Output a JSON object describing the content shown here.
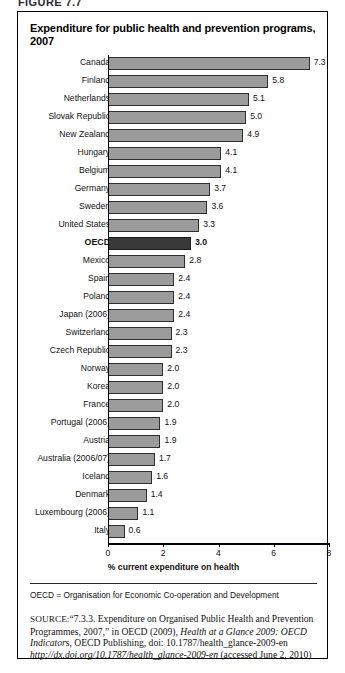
{
  "figure": {
    "label": "FIGURE 7.7"
  },
  "chart": {
    "title": "Expenditure for public health and prevention programs, 2007"
  },
  "notes": {
    "abbreviation": "OECD = Organisation for Economic Co-operation and Development",
    "source_label": "SOURCE:",
    "source_part1": "“7.3.3. Expenditure on Organised Public Health and Prevention Programmes, 2007,” in OECD (2009), ",
    "source_italic1": "Health at a Glance 2009: OECD Indicator",
    "source_part2": "s, OECD Publishing, doi: 10.1787/health_glance-2009-en ",
    "source_italic2": "http://dx.doi.org/10.1787/health_glance-2009-en",
    "source_part3": " (accessed June 2, 2010)"
  },
  "chart_data": {
    "type": "bar",
    "orientation": "horizontal",
    "title": "Expenditure for public health and prevention programs, 2007",
    "xlabel": "% current expenditure on health",
    "ylabel": "",
    "xlim": [
      0,
      8
    ],
    "xticks": [
      0,
      2,
      4,
      6,
      8
    ],
    "xtick_labels": [
      "0",
      "2",
      "4",
      "6",
      "8"
    ],
    "grid": false,
    "legend": false,
    "bar_color": "#9b9b9b",
    "highlight_color": "#393939",
    "highlight_category": "OECD",
    "categories": [
      "Canada",
      "Finland",
      "Netherlands",
      "Slovak Republic",
      "New Zealand",
      "Hungary",
      "Belgium",
      "Germany",
      "Sweden",
      "United States",
      "OECD",
      "Mexico",
      "Spain",
      "Poland",
      "Japan (2006)",
      "Switzerland",
      "Czech Republic",
      "Norway",
      "Korea",
      "France",
      "Portugal (2006)",
      "Austria",
      "Australia (2006/07)",
      "Iceland",
      "Denmark",
      "Luxembourg (2006)",
      "Italy"
    ],
    "values": [
      7.3,
      5.8,
      5.1,
      5.0,
      4.9,
      4.1,
      4.1,
      3.7,
      3.6,
      3.3,
      3.0,
      2.8,
      2.4,
      2.4,
      2.4,
      2.3,
      2.3,
      2.0,
      2.0,
      2.0,
      1.9,
      1.9,
      1.7,
      1.6,
      1.4,
      1.1,
      0.6
    ],
    "value_labels": [
      "7.3",
      "5.8",
      "5.1",
      "5.0",
      "4.9",
      "4.1",
      "4.1",
      "3.7",
      "3.6",
      "3.3",
      "3.0",
      "2.8",
      "2.4",
      "2.4",
      "2.4",
      "2.3",
      "2.3",
      "2.0",
      "2.0",
      "2.0",
      "1.9",
      "1.9",
      "1.7",
      "1.6",
      "1.4",
      "1.1",
      "0.6"
    ]
  }
}
